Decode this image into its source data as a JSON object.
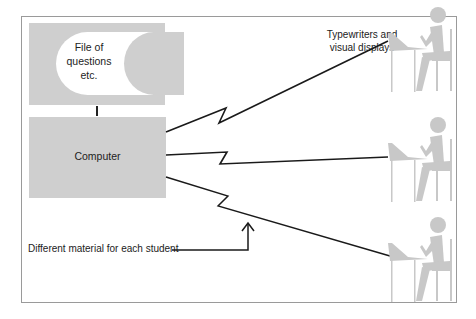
{
  "diagram": {
    "file_box": {
      "label_lines": [
        "File of",
        "questions",
        "etc."
      ]
    },
    "computer_box": {
      "label": "Computer"
    },
    "terminals": {
      "label_lines": [
        "Typewriters and",
        "visual displays"
      ],
      "count": 3,
      "icon": "student-at-terminal-icon"
    },
    "annotation": {
      "label": "Different material for each student"
    },
    "colors": {
      "box_fill": "#cfcfcf",
      "figure_fill": "#c8c8c8",
      "line": "#1a1a1a",
      "frame": "#9a9a9a"
    }
  }
}
